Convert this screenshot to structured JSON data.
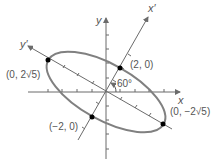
{
  "diagram": {
    "type": "rotated-ellipse",
    "rotation_angle_label": "60°",
    "axes": {
      "x": "x",
      "y": "y",
      "x_prime": "x′",
      "y_prime": "y′"
    },
    "points": [
      {
        "label": "(0, 2√5)",
        "coords": "(0, 2√5)"
      },
      {
        "label": "(2, 0)",
        "coords": "(2, 0)"
      },
      {
        "label": "(−2, 0)",
        "coords": "(−2, 0)"
      },
      {
        "label": "(0, −2√5)",
        "coords": "(0, −2√5)"
      }
    ],
    "colors": {
      "ellipse": "#808080",
      "axes": "#6b6b6b",
      "points": "#000000",
      "text": "#555555"
    }
  }
}
